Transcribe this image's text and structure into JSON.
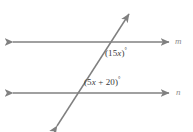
{
  "figure": {
    "type": "geometry-diagram",
    "background_color": "#ffffff",
    "line_color": "#808080",
    "label_color": "#3a3a3a",
    "line_name_color": "#8c8c8c",
    "lines": [
      {
        "name": "m",
        "role": "upper-parallel-line",
        "orientation": "horizontal",
        "arrowheads": "both",
        "label": "m"
      },
      {
        "name": "n",
        "role": "lower-parallel-line",
        "orientation": "horizontal",
        "arrowheads": "both",
        "label": "n"
      },
      {
        "name": "transversal",
        "role": "transversal",
        "orientation": "oblique",
        "arrowheads": "both",
        "label": ""
      }
    ],
    "angles": {
      "upper": {
        "open_paren": "(",
        "coefficient": "15",
        "variable": "x",
        "close_paren": ")",
        "degree_symbol": "°",
        "full_text": "(15x)°",
        "position": "below-right of upper intersection"
      },
      "lower": {
        "open_paren": "(",
        "coefficient": "5",
        "variable": "x",
        "operator": "+",
        "constant": "20",
        "close_paren": ")",
        "degree_symbol": "°",
        "full_text": "(5x + 20)°",
        "position": "above-right of lower intersection"
      }
    }
  }
}
